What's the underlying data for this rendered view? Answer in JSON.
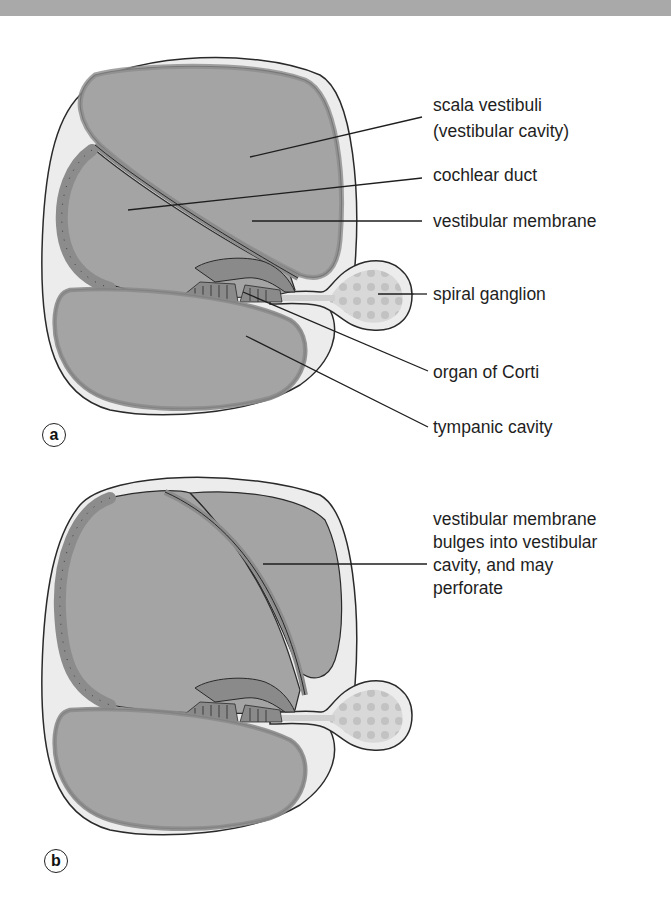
{
  "figure": {
    "colors": {
      "background": "#ffffff",
      "top_band": "#a9a9a9",
      "outer_tissue": "#ececec",
      "cavity_fill": "#a4a4a4",
      "epithelium": "#8c8c8c",
      "organ_of_corti": "#8a8a8a",
      "ganglion_fill": "#d2d2d2",
      "outline": "#2a2a2a",
      "label_text": "#1e1e1e"
    },
    "panel_a": {
      "badge": "a",
      "labels": [
        {
          "id": "scala-vestibuli",
          "text": "scala vestibuli"
        },
        {
          "id": "vestibular-cavity",
          "text": "(vestibular cavity)"
        },
        {
          "id": "cochlear-duct",
          "text": "cochlear duct"
        },
        {
          "id": "vestibular-membrane",
          "text": "vestibular membrane"
        },
        {
          "id": "spiral-ganglion",
          "text": "spiral ganglion"
        },
        {
          "id": "organ-of-corti",
          "text": "organ of Corti"
        },
        {
          "id": "tympanic-cavity",
          "text": "tympanic cavity"
        }
      ]
    },
    "panel_b": {
      "badge": "b",
      "annotation_lines": [
        "vestibular membrane",
        "bulges into vestibular",
        "cavity, and may",
        "perforate"
      ]
    }
  }
}
